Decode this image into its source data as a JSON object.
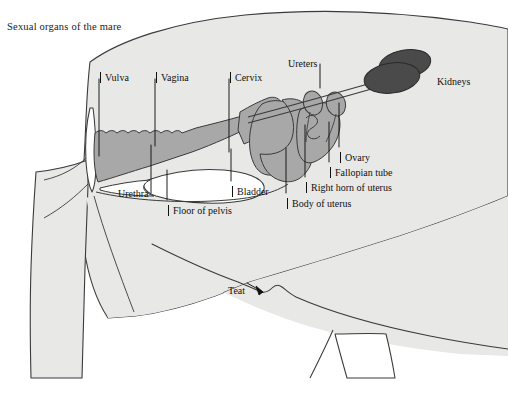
{
  "figure": {
    "title": "Sexual organs of the mare",
    "subject": "mare",
    "view": "left lateral sagittal section",
    "colors": {
      "background": "#ffffff",
      "body_fill": "#e8e8e6",
      "body_outline": "#3a3a3a",
      "organ_fill": "#a8a8a8",
      "organ_outline": "#3a3a3a",
      "kidney_fill": "#4a4a4a",
      "hollow_fill": "#ffffff",
      "leader_line": "#111111",
      "text": "#111111"
    }
  },
  "labels": [
    {
      "id": "vulva",
      "text": "Vulva",
      "x": 100,
      "y": 72,
      "style": "tick"
    },
    {
      "id": "vagina",
      "text": "Vagina",
      "x": 156,
      "y": 72,
      "style": "tick"
    },
    {
      "id": "cervix",
      "text": "Cervix",
      "x": 230,
      "y": 72,
      "style": "tick"
    },
    {
      "id": "ureters",
      "text": "Ureters",
      "x": 288,
      "y": 58,
      "style": "plain"
    },
    {
      "id": "kidneys",
      "text": "Kidneys",
      "x": 437,
      "y": 76,
      "style": "plain"
    },
    {
      "id": "ovary",
      "text": "Ovary",
      "x": 340,
      "y": 152,
      "style": "tick"
    },
    {
      "id": "fallopian-tube",
      "text": "Fallopian tube",
      "x": 330,
      "y": 167,
      "style": "tick"
    },
    {
      "id": "right-horn-of-uterus",
      "text": "Right horn of uterus",
      "x": 306,
      "y": 182,
      "style": "tick"
    },
    {
      "id": "body-of-uterus",
      "text": "Body of uterus",
      "x": 287,
      "y": 198,
      "style": "tick"
    },
    {
      "id": "bladder",
      "text": "Bladder",
      "x": 232,
      "y": 186,
      "style": "tick"
    },
    {
      "id": "urethra",
      "text": "Urethra",
      "x": 118,
      "y": 188,
      "style": "plain"
    },
    {
      "id": "floor-of-pelvis",
      "text": "Floor of pelvis",
      "x": 168,
      "y": 205,
      "style": "tick"
    },
    {
      "id": "teat",
      "text": "Teat",
      "x": 228,
      "y": 285,
      "style": "plain"
    }
  ],
  "leaders": [
    {
      "id": "leader-vulva",
      "points": "99,79 99,156"
    },
    {
      "id": "leader-vagina",
      "points": "155,79 155,146"
    },
    {
      "id": "leader-cervix",
      "points": "229,79 229,152"
    },
    {
      "id": "leader-ureters",
      "points": "320,64 320,88"
    },
    {
      "id": "leader-ovary",
      "points": "339,147 339,103"
    },
    {
      "id": "leader-fallopian-tube",
      "points": "329,162 329,122"
    },
    {
      "id": "leader-right-horn-of-uterus",
      "points": "305,177 305,125"
    },
    {
      "id": "leader-body-of-uterus",
      "points": "286,193 286,148"
    },
    {
      "id": "leader-bladder",
      "points": "231,181 231,149"
    },
    {
      "id": "leader-urethra",
      "points": "151,193 151,145"
    },
    {
      "id": "leader-floor-of-pelvis",
      "points": "167,200 167,170"
    },
    {
      "id": "leader-teat",
      "points": "247,283 263,292"
    }
  ]
}
